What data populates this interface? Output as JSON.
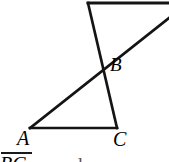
{
  "figure": {
    "background_color": "#ffffff",
    "stroke_color": "#141414",
    "labels": {
      "a": "A",
      "b": "B",
      "c": "C"
    }
  },
  "caption": {
    "clipped_text": "BC",
    "trailing_clipped_text": "and",
    "overline_present": "true"
  },
  "chart_data": {
    "type": "diagram",
    "canvas": {
      "width": 169,
      "height": 162
    },
    "points": [
      {
        "name": "A",
        "x": 30,
        "y": 128,
        "label": "A",
        "label_x": 22,
        "label_y": 145
      },
      {
        "name": "B",
        "x": 103,
        "y": 68,
        "label": "B",
        "label_x": 115,
        "label_y": 72
      },
      {
        "name": "C",
        "x": 117,
        "y": 128,
        "label": "C",
        "label_x": 118,
        "label_y": 146
      },
      {
        "name": "T",
        "x": 88,
        "y": 3,
        "label": "",
        "label_x": 0,
        "label_y": 0
      },
      {
        "name": "R1",
        "x": 169,
        "y": 3,
        "label": "",
        "label_x": 0,
        "label_y": 0
      },
      {
        "name": "R2",
        "x": 169,
        "y": 18,
        "label": "",
        "label_x": 0,
        "label_y": 0
      }
    ],
    "segments": [
      {
        "name": "top-horizontal",
        "from": "T",
        "to": "R1",
        "x1": 88,
        "y1": 3,
        "x2": 169,
        "y2": 3
      },
      {
        "name": "transversal-T-to-C",
        "from": "T",
        "to": "C",
        "x1": 88,
        "y1": 3,
        "x2": 117,
        "y2": 128
      },
      {
        "name": "ray-A-through-B",
        "from": "A",
        "to": "R2",
        "x1": 30,
        "y1": 128,
        "x2": 169,
        "y2": 18
      },
      {
        "name": "base-A-to-C",
        "from": "A",
        "to": "C",
        "x1": 30,
        "y1": 128,
        "x2": 117,
        "y2": 128
      }
    ],
    "stroke_width": 2.6,
    "grid": "off",
    "legend": "none"
  }
}
